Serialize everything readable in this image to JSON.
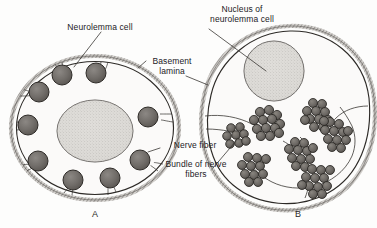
{
  "figure": {
    "title_alt": "Neurolemma (Schwann) cells ensheathing nerve fibers",
    "background_color": "#fdfdfc",
    "ink_color": "#23211f",
    "fiber_fill": "#6e6a66",
    "nucleus_fill": "#d8d6d2",
    "lamina_fill": "#a9a6a2"
  },
  "labels": {
    "neurolemma_cell": "Neurolemma cell",
    "nucleus_of_neurolemma_cell_line1": "Nucleus of",
    "nucleus_of_neurolemma_cell_line2": "neurolemma cell",
    "basement_lamina_line1": "Basement",
    "basement_lamina_line2": "lamina",
    "nerve_fiber": "Nerve fiber",
    "bundle_of_nerve_fibers_line1": "Bundle of nerve",
    "bundle_of_nerve_fibers_line2": "fibers"
  },
  "panels": {
    "a": "A",
    "b": "B"
  },
  "cell_a": {
    "name": "neurolemma-cell-a",
    "description": "Single neurolemma cell enclosing several individual nerve fibers",
    "nucleus": {
      "cx": 95,
      "cy": 131,
      "rx": 38,
      "ry": 31
    },
    "fiber_count": 9,
    "fibers": [
      {
        "cx": 62,
        "cy": 75,
        "r": 10
      },
      {
        "cx": 96,
        "cy": 73,
        "r": 10
      },
      {
        "cx": 39,
        "cy": 92,
        "r": 10
      },
      {
        "cx": 28,
        "cy": 125,
        "r": 10
      },
      {
        "cx": 38,
        "cy": 161,
        "r": 10
      },
      {
        "cx": 73,
        "cy": 180,
        "r": 10
      },
      {
        "cx": 110,
        "cy": 178,
        "r": 10
      },
      {
        "cx": 140,
        "cy": 160,
        "r": 10
      },
      {
        "cx": 148,
        "cy": 117,
        "r": 10
      }
    ]
  },
  "cell_b": {
    "name": "neurolemma-cell-b",
    "description": "Single neurolemma cell enclosing bundles of many small nerve fibers",
    "nucleus": {
      "cx": 274,
      "cy": 71,
      "r": 30
    },
    "bundle_count": 7,
    "bundles": [
      {
        "cx": 268,
        "cy": 123,
        "r": 17,
        "dots": 13
      },
      {
        "cx": 236,
        "cy": 135,
        "r": 12,
        "dots": 8
      },
      {
        "cx": 318,
        "cy": 113,
        "r": 15,
        "dots": 11
      },
      {
        "cx": 334,
        "cy": 133,
        "r": 16,
        "dots": 12
      },
      {
        "cx": 300,
        "cy": 152,
        "r": 15,
        "dots": 11
      },
      {
        "cx": 253,
        "cy": 168,
        "r": 15,
        "dots": 11
      },
      {
        "cx": 317,
        "cy": 180,
        "r": 16,
        "dots": 12
      }
    ]
  }
}
